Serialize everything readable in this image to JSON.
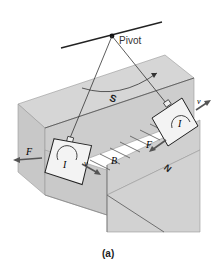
{
  "figure": {
    "caption": "(a)",
    "labels": {
      "pivot": "Pivot",
      "south_pole": "S",
      "north_pole": "N",
      "field": "B",
      "current_left": "I",
      "current_right": "I",
      "force_left": "F",
      "force_right": "F",
      "velocity_left": "v",
      "velocity_right": "v"
    },
    "colors": {
      "magnet_top": "#d4d4d4",
      "magnet_side": "#c4c4c4",
      "magnet_front": "#cbcbcb",
      "plate": "#f2f2f2",
      "arrow": "#555555",
      "line": "#222222"
    }
  }
}
